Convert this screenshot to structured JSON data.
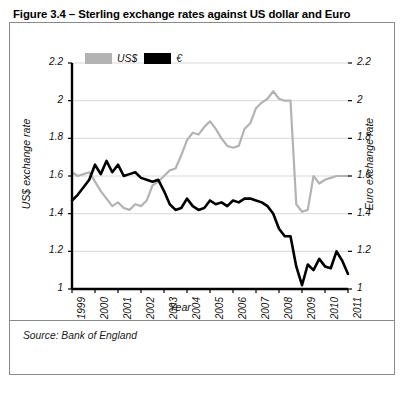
{
  "figure": {
    "title": "Figure 3.4 – Sterling exchange rates against US dollar and Euro",
    "source": "Source: Bank of England"
  },
  "legend": {
    "items": [
      {
        "label": "US$",
        "color": "#b3b3b3"
      },
      {
        "label": "€",
        "color": "#000000"
      }
    ]
  },
  "chart_data": {
    "type": "line",
    "title": "Figure 3.4 – Sterling exchange rates against US dollar and Euro",
    "xlabel": "Year",
    "ylabel": "US$ exchange rate",
    "y2label": "Euro exchange rate",
    "xlim": [
      1999,
      2011
    ],
    "ylim": [
      1,
      2.2
    ],
    "yticks": [
      "1",
      "1.2",
      "1.4",
      "1.6",
      "1.8",
      "2",
      "2.2"
    ],
    "y2ticks": [
      "1",
      "1.2",
      "1.4",
      "1.6",
      "1.8",
      "2",
      "2.2"
    ],
    "xticks": [
      "1999",
      "2000",
      "2001",
      "2002",
      "2003",
      "2004",
      "2005",
      "2006",
      "2007",
      "2008",
      "2009",
      "2010",
      "2011"
    ],
    "grid": true,
    "legend_position": "top-left",
    "series": [
      {
        "name": "US$",
        "color": "#b3b3b3",
        "x": [
          1999.0,
          1999.25,
          1999.5,
          1999.75,
          2000.0,
          2000.25,
          2000.5,
          2000.75,
          2001.0,
          2001.25,
          2001.5,
          2001.75,
          2002.0,
          2002.25,
          2002.5,
          2002.75,
          2003.0,
          2003.25,
          2003.5,
          2003.75,
          2004.0,
          2004.25,
          2004.5,
          2004.75,
          2005.0,
          2005.25,
          2005.5,
          2005.75,
          2006.0,
          2006.25,
          2006.5,
          2006.75,
          2007.0,
          2007.25,
          2007.5,
          2007.75,
          2008.0,
          2008.25,
          2008.5,
          2008.75,
          2009.0,
          2009.25,
          2009.5,
          2009.75,
          2010.0,
          2010.25,
          2010.5,
          2010.75,
          2011.0
        ],
        "y": [
          1.62,
          1.6,
          1.61,
          1.62,
          1.57,
          1.52,
          1.48,
          1.44,
          1.46,
          1.43,
          1.42,
          1.45,
          1.44,
          1.47,
          1.55,
          1.57,
          1.6,
          1.63,
          1.64,
          1.71,
          1.79,
          1.83,
          1.82,
          1.86,
          1.89,
          1.85,
          1.8,
          1.76,
          1.75,
          1.76,
          1.85,
          1.88,
          1.96,
          1.99,
          2.01,
          2.05,
          2.01,
          2.0,
          2.0,
          1.45,
          1.41,
          1.42,
          1.6,
          1.56,
          1.58,
          1.59,
          1.6,
          1.6,
          1.6
        ]
      },
      {
        "name": "€",
        "color": "#000000",
        "x": [
          1999.0,
          1999.25,
          1999.5,
          1999.75,
          2000.0,
          2000.25,
          2000.5,
          2000.75,
          2001.0,
          2001.25,
          2001.5,
          2001.75,
          2002.0,
          2002.25,
          2002.5,
          2002.75,
          2003.0,
          2003.25,
          2003.5,
          2003.75,
          2004.0,
          2004.25,
          2004.5,
          2004.75,
          2005.0,
          2005.25,
          2005.5,
          2005.75,
          2006.0,
          2006.25,
          2006.5,
          2006.75,
          2007.0,
          2007.25,
          2007.5,
          2007.75,
          2008.0,
          2008.25,
          2008.5,
          2008.75,
          2009.0,
          2009.25,
          2009.5,
          2009.75,
          2010.0,
          2010.25,
          2010.5,
          2010.75,
          2011.0
        ],
        "y": [
          1.47,
          1.5,
          1.54,
          1.58,
          1.66,
          1.61,
          1.68,
          1.62,
          1.66,
          1.6,
          1.61,
          1.62,
          1.59,
          1.58,
          1.57,
          1.58,
          1.52,
          1.45,
          1.42,
          1.43,
          1.48,
          1.44,
          1.42,
          1.43,
          1.47,
          1.45,
          1.46,
          1.44,
          1.47,
          1.46,
          1.48,
          1.48,
          1.47,
          1.46,
          1.44,
          1.4,
          1.32,
          1.28,
          1.28,
          1.12,
          1.02,
          1.13,
          1.1,
          1.16,
          1.12,
          1.11,
          1.2,
          1.15,
          1.08
        ]
      }
    ]
  }
}
